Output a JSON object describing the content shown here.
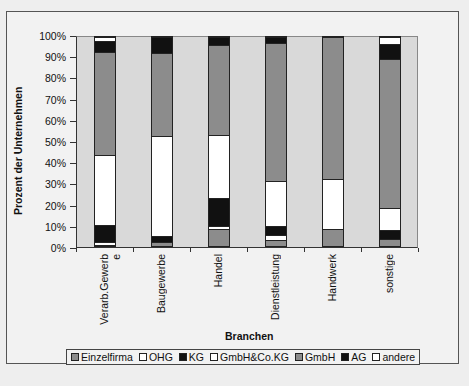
{
  "chart_data": {
    "type": "bar",
    "stacked": true,
    "percent": true,
    "title": "",
    "xlabel": "Branchen",
    "ylabel": "Prozent der Unternehmen",
    "ylim": [
      0,
      100
    ],
    "yticks": [
      "0%",
      "10%",
      "20%",
      "30%",
      "40%",
      "50%",
      "60%",
      "70%",
      "80%",
      "90%",
      "100%"
    ],
    "categories": [
      "Verarb.Gewerbe",
      "Baugewerbe",
      "Handel",
      "Dienstleistung",
      "Handwerk",
      "sonstige"
    ],
    "category_labels_display": [
      "Verarb.Gewerb\ne",
      "Baugewerbe",
      "Handel",
      "Dienstleistung",
      "Handwerk",
      "sonstige"
    ],
    "series": [
      {
        "name": "Einzelfirma",
        "color": "#8c8c8c",
        "values": [
          0.5,
          2,
          8,
          3,
          8,
          3.5
        ]
      },
      {
        "name": "OHG",
        "color": "#ffffff",
        "values": [
          1.5,
          0,
          1.5,
          2.5,
          0,
          0
        ]
      },
      {
        "name": "KG",
        "color": "#111111",
        "values": [
          8,
          3,
          13.5,
          4,
          0,
          4
        ]
      },
      {
        "name": "GmbH&Co.KG",
        "color": "#ffffff",
        "values": [
          33.5,
          47.5,
          30,
          21.5,
          24,
          10.5
        ]
      },
      {
        "name": "GmbH",
        "color": "#8c8c8c",
        "values": [
          49.5,
          40,
          43,
          66,
          68,
          71.5
        ]
      },
      {
        "name": "AG",
        "color": "#111111",
        "values": [
          5,
          7.5,
          4,
          3,
          0,
          7
        ]
      },
      {
        "name": "andere",
        "color": "#ffffff",
        "values": [
          2,
          0,
          0,
          0,
          0,
          3.5
        ]
      }
    ],
    "legend_position": "bottom",
    "grid": false
  },
  "legend": {
    "items": [
      {
        "label": "Einzelfirma",
        "color": "#8c8c8c"
      },
      {
        "label": "OHG",
        "color": "#ffffff"
      },
      {
        "label": "KG",
        "color": "#111111"
      },
      {
        "label": "GmbH&Co.KG",
        "color": "#ffffff"
      },
      {
        "label": "GmbH",
        "color": "#8c8c8c"
      },
      {
        "label": "AG",
        "color": "#111111"
      },
      {
        "label": "andere",
        "color": "#ffffff"
      }
    ]
  }
}
